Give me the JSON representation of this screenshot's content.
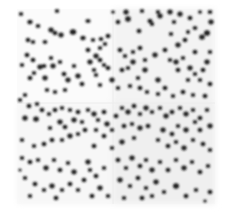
{
  "image": {
    "kind": "grayscale nuclear-stain microscopy mosaic",
    "width": 226,
    "height": 215,
    "background_color": "#ffffff",
    "field": {
      "x": 17,
      "y": 9,
      "w": 198,
      "h": 195,
      "color": "#fbfbfb"
    },
    "tile_seams": {
      "x": 113,
      "y": 103,
      "color": "#ececec"
    },
    "tile_shading": [
      {
        "x": 113,
        "y": 9,
        "w": 102,
        "h": 94,
        "color": "#f3f3f3"
      },
      {
        "x": 113,
        "y": 103,
        "w": 102,
        "h": 101,
        "color": "#efefef"
      },
      {
        "x": 17,
        "y": 103,
        "w": 96,
        "h": 101,
        "color": "#f7f7f7"
      }
    ],
    "nucleus_color": "#1c1c1c",
    "nuclei": [
      [
        21,
        14,
        2.2,
        2
      ],
      [
        30,
        22,
        2.6,
        2.3
      ],
      [
        38,
        26,
        2.3,
        2
      ],
      [
        28,
        40,
        2.3,
        2.3
      ],
      [
        33,
        42,
        2.2,
        2
      ],
      [
        45,
        42,
        2.4,
        2
      ],
      [
        51,
        30,
        2.6,
        2.4
      ],
      [
        55,
        33,
        2.4,
        2.2
      ],
      [
        61,
        35,
        2.6,
        2.4
      ],
      [
        57,
        11,
        2.2,
        2
      ],
      [
        73,
        32,
        3.2,
        2.8
      ],
      [
        88,
        21,
        2.6,
        2
      ],
      [
        83,
        38,
        2.6,
        2.3
      ],
      [
        93,
        40,
        2.2,
        2
      ],
      [
        101,
        39,
        2.4,
        2
      ],
      [
        100,
        48,
        2.2,
        2
      ],
      [
        105,
        44,
        2.2,
        2
      ],
      [
        108,
        36,
        2.4,
        2.2
      ],
      [
        113,
        12,
        2,
        1.6
      ],
      [
        118,
        22,
        2.3,
        2.3
      ],
      [
        126,
        12,
        2.6,
        2.6
      ],
      [
        128,
        19,
        2.8,
        2.8
      ],
      [
        139,
        31,
        2.4,
        2.2
      ],
      [
        142,
        11,
        2.2,
        2
      ],
      [
        150,
        21,
        2.5,
        2.3
      ],
      [
        152,
        24,
        2.2,
        2
      ],
      [
        158,
        12,
        2.2,
        2
      ],
      [
        160,
        16,
        2.6,
        2.4
      ],
      [
        170,
        12,
        2.6,
        2.4
      ],
      [
        174,
        22,
        2.2,
        2
      ],
      [
        180,
        14,
        2.6,
        2.6
      ],
      [
        190,
        18,
        2.4,
        2.2
      ],
      [
        195,
        28,
        2.4,
        2
      ],
      [
        207,
        33,
        3,
        2.8
      ],
      [
        202,
        37,
        2.8,
        2.6
      ],
      [
        211,
        22,
        2.6,
        2.4
      ],
      [
        210,
        12,
        2.3,
        2
      ],
      [
        200,
        12,
        2,
        1.8
      ],
      [
        188,
        32,
        2,
        2
      ],
      [
        185,
        40,
        2.4,
        2.2
      ],
      [
        171,
        34,
        2.2,
        2
      ],
      [
        178,
        45,
        2.6,
        2.4
      ],
      [
        27,
        55,
        2.4,
        2.2
      ],
      [
        22,
        65,
        2.2,
        2
      ],
      [
        33,
        60,
        2.4,
        2.2
      ],
      [
        40,
        67,
        2.6,
        2.4
      ],
      [
        44,
        66,
        2.4,
        2
      ],
      [
        34,
        73,
        2.2,
        2
      ],
      [
        30,
        78,
        2.4,
        2.2
      ],
      [
        25,
        95,
        2.2,
        2
      ],
      [
        45,
        78,
        2.6,
        2.4
      ],
      [
        51,
        58,
        2.2,
        2
      ],
      [
        53,
        66,
        2.6,
        2.4
      ],
      [
        60,
        62,
        2.2,
        2
      ],
      [
        64,
        74,
        2.4,
        2.2
      ],
      [
        68,
        80,
        2.6,
        2.4
      ],
      [
        74,
        66,
        2.2,
        2
      ],
      [
        78,
        76,
        2.6,
        2.4
      ],
      [
        82,
        84,
        2.4,
        2.2
      ],
      [
        65,
        90,
        2.2,
        2
      ],
      [
        55,
        92,
        2.2,
        2
      ],
      [
        47,
        90,
        2.2,
        2
      ],
      [
        88,
        50,
        2.4,
        2.2
      ],
      [
        96,
        56,
        2.6,
        2.4
      ],
      [
        94,
        70,
        2.2,
        2
      ],
      [
        90,
        62,
        2.6,
        2.4
      ],
      [
        100,
        60,
        2.4,
        2.2
      ],
      [
        104,
        65,
        2.2,
        2
      ],
      [
        96,
        75,
        2.2,
        2
      ],
      [
        108,
        68,
        2.4,
        2.2
      ],
      [
        112,
        80,
        2.6,
        2.4
      ],
      [
        100,
        85,
        2.2,
        2
      ],
      [
        118,
        88,
        2.2,
        2
      ],
      [
        122,
        70,
        2.4,
        2.2
      ],
      [
        128,
        68,
        2.2,
        2
      ],
      [
        133,
        62,
        2.6,
        2.4
      ],
      [
        125,
        56,
        2.2,
        2
      ],
      [
        120,
        50,
        2.4,
        2.2
      ],
      [
        133,
        52,
        2.2,
        2
      ],
      [
        140,
        48,
        2.4,
        2.2
      ],
      [
        145,
        60,
        2.2,
        2
      ],
      [
        145,
        70,
        2.6,
        2.4
      ],
      [
        138,
        78,
        2.2,
        2
      ],
      [
        130,
        86,
        2.2,
        2
      ],
      [
        140,
        88,
        2.4,
        2.2
      ],
      [
        147,
        92,
        2.2,
        2
      ],
      [
        155,
        55,
        2.6,
        2.4
      ],
      [
        165,
        50,
        2.4,
        2.2
      ],
      [
        170,
        60,
        2.2,
        2
      ],
      [
        176,
        62,
        2.6,
        2.4
      ],
      [
        183,
        58,
        2.2,
        2
      ],
      [
        178,
        70,
        2.4,
        2.2
      ],
      [
        190,
        68,
        2.6,
        2.4
      ],
      [
        195,
        74,
        2.2,
        2
      ],
      [
        203,
        70,
        2.4,
        2.2
      ],
      [
        207,
        62,
        2.6,
        2.4
      ],
      [
        210,
        52,
        2.2,
        2
      ],
      [
        195,
        52,
        2.4,
        2.2
      ],
      [
        188,
        80,
        2.2,
        2
      ],
      [
        200,
        80,
        2.2,
        2
      ],
      [
        210,
        84,
        2.4,
        2.2
      ],
      [
        158,
        80,
        2.6,
        2.4
      ],
      [
        165,
        88,
        2.4,
        2.2
      ],
      [
        158,
        94,
        2.2,
        2
      ],
      [
        173,
        96,
        2.2,
        2
      ],
      [
        183,
        92,
        2.4,
        2.2
      ],
      [
        193,
        95,
        2.2,
        2
      ],
      [
        205,
        96,
        2.4,
        2.2
      ],
      [
        20,
        100,
        2.2,
        2
      ],
      [
        29,
        106,
        2.4,
        2.2
      ],
      [
        37,
        104,
        2.2,
        2
      ],
      [
        42,
        110,
        2.4,
        2.2
      ],
      [
        25,
        118,
        2.6,
        2.6
      ],
      [
        36,
        119,
        2.8,
        2.6
      ],
      [
        49,
        114,
        2.2,
        2
      ],
      [
        55,
        110,
        2.4,
        2.2
      ],
      [
        62,
        108,
        2.2,
        2
      ],
      [
        60,
        122,
        2.6,
        2.4
      ],
      [
        65,
        127,
        2.4,
        2.2
      ],
      [
        70,
        110,
        2.2,
        2
      ],
      [
        74,
        120,
        2.6,
        2.4
      ],
      [
        78,
        112,
        2.4,
        2.2
      ],
      [
        82,
        122,
        2.2,
        2
      ],
      [
        85,
        130,
        2.4,
        2.2
      ],
      [
        78,
        134,
        2.2,
        2
      ],
      [
        70,
        136,
        2.6,
        2.4
      ],
      [
        62,
        140,
        2.2,
        2
      ],
      [
        52,
        140,
        2.4,
        2.2
      ],
      [
        44,
        144,
        2.4,
        2.2
      ],
      [
        34,
        146,
        2.2,
        2
      ],
      [
        22,
        140,
        2.2,
        2
      ],
      [
        50,
        128,
        2.2,
        2
      ],
      [
        88,
        110,
        2.2,
        2
      ],
      [
        94,
        114,
        2.6,
        2.4
      ],
      [
        98,
        120,
        2.2,
        2
      ],
      [
        104,
        112,
        2.4,
        2.2
      ],
      [
        107,
        124,
        2.6,
        2.4
      ],
      [
        96,
        130,
        2.2,
        2
      ],
      [
        104,
        136,
        2.4,
        2.2
      ],
      [
        112,
        130,
        2.2,
        2
      ],
      [
        116,
        116,
        2.4,
        2.2
      ],
      [
        122,
        108,
        2.2,
        2
      ],
      [
        128,
        112,
        2.6,
        2.4
      ],
      [
        134,
        106,
        2.4,
        2.2
      ],
      [
        140,
        114,
        2.2,
        2
      ],
      [
        146,
        108,
        2.6,
        2.4
      ],
      [
        152,
        112,
        2.2,
        2
      ],
      [
        124,
        126,
        2.4,
        2.2
      ],
      [
        132,
        124,
        2.2,
        2
      ],
      [
        140,
        128,
        2.6,
        2.4
      ],
      [
        148,
        126,
        2.4,
        2.2
      ],
      [
        134,
        138,
        2.2,
        2
      ],
      [
        122,
        142,
        2.6,
        2.4
      ],
      [
        112,
        148,
        2.2,
        2
      ],
      [
        94,
        146,
        2.4,
        2.2
      ],
      [
        160,
        108,
        2.2,
        2
      ],
      [
        166,
        116,
        2.6,
        2.4
      ],
      [
        172,
        112,
        2.4,
        2.2
      ],
      [
        180,
        108,
        2.2,
        2
      ],
      [
        186,
        114,
        2.6,
        2.4
      ],
      [
        193,
        110,
        2.2,
        2
      ],
      [
        200,
        118,
        2.4,
        2.2
      ],
      [
        207,
        110,
        2.2,
        2
      ],
      [
        210,
        126,
        2.6,
        2.4
      ],
      [
        200,
        130,
        2.4,
        2.2
      ],
      [
        195,
        122,
        2.2,
        2
      ],
      [
        186,
        130,
        2.6,
        2.4
      ],
      [
        178,
        126,
        2.2,
        2
      ],
      [
        172,
        134,
        2.4,
        2.2
      ],
      [
        163,
        130,
        2.6,
        2.4
      ],
      [
        158,
        140,
        2.2,
        2
      ],
      [
        168,
        146,
        2.4,
        2.2
      ],
      [
        176,
        142,
        2.2,
        2
      ],
      [
        184,
        148,
        2.6,
        2.4
      ],
      [
        193,
        140,
        2.2,
        2
      ],
      [
        203,
        144,
        2.4,
        2.2
      ],
      [
        210,
        150,
        2.2,
        2
      ],
      [
        22,
        158,
        2.2,
        2
      ],
      [
        30,
        162,
        2.4,
        2.2
      ],
      [
        38,
        160,
        2.2,
        2
      ],
      [
        46,
        168,
        2.6,
        2.4
      ],
      [
        54,
        160,
        2.2,
        2
      ],
      [
        60,
        170,
        2.4,
        2.2
      ],
      [
        68,
        163,
        2.2,
        2
      ],
      [
        74,
        172,
        2.6,
        2.4
      ],
      [
        25,
        178,
        2.2,
        2
      ],
      [
        35,
        184,
        2.4,
        2.2
      ],
      [
        44,
        190,
        2.2,
        2
      ],
      [
        52,
        186,
        2.6,
        2.4
      ],
      [
        62,
        190,
        2.2,
        2
      ],
      [
        70,
        184,
        2.4,
        2.2
      ],
      [
        78,
        190,
        2.2,
        2
      ],
      [
        84,
        180,
        2.4,
        2.2
      ],
      [
        90,
        170,
        2.2,
        2
      ],
      [
        88,
        162,
        2.6,
        2.4
      ],
      [
        96,
        176,
        2.4,
        2.2
      ],
      [
        104,
        168,
        2.2,
        2
      ],
      [
        100,
        188,
        2.6,
        2.4
      ],
      [
        108,
        196,
        2.2,
        2
      ],
      [
        92,
        196,
        2.4,
        2.2
      ],
      [
        30,
        196,
        2.2,
        2
      ],
      [
        56,
        198,
        2.4,
        2.2
      ],
      [
        20,
        170,
        1.6,
        1.6
      ],
      [
        118,
        160,
        2.4,
        2.2
      ],
      [
        126,
        168,
        2.2,
        2
      ],
      [
        132,
        158,
        2.6,
        2.4
      ],
      [
        140,
        166,
        2.4,
        2.2
      ],
      [
        146,
        160,
        2.2,
        2
      ],
      [
        152,
        170,
        2.6,
        2.4
      ],
      [
        160,
        162,
        2.2,
        2
      ],
      [
        168,
        170,
        2.4,
        2.2
      ],
      [
        176,
        160,
        2.2,
        2
      ],
      [
        184,
        168,
        2.6,
        2.4
      ],
      [
        192,
        162,
        2.2,
        2
      ],
      [
        200,
        172,
        2.4,
        2.2
      ],
      [
        208,
        166,
        2.2,
        2
      ],
      [
        120,
        180,
        2.6,
        2.4
      ],
      [
        130,
        186,
        2.2,
        2
      ],
      [
        138,
        178,
        2.4,
        2.2
      ],
      [
        146,
        188,
        2.2,
        2
      ],
      [
        156,
        182,
        2.6,
        2.4
      ],
      [
        164,
        192,
        2.2,
        2
      ],
      [
        176,
        186,
        3,
        2.8
      ],
      [
        186,
        196,
        2.4,
        2.2
      ],
      [
        196,
        190,
        2.2,
        2
      ],
      [
        210,
        192,
        2.4,
        2.2
      ],
      [
        205,
        201,
        1.8,
        1.6
      ],
      [
        124,
        198,
        2.2,
        2
      ],
      [
        142,
        198,
        2.4,
        2.2
      ],
      [
        152,
        196,
        2.2,
        2
      ]
    ]
  }
}
